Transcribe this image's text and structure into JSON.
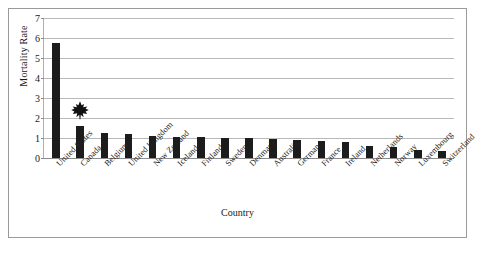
{
  "chart_data": {
    "type": "bar",
    "title": "",
    "xlabel": "Country",
    "ylabel": "Mortality Rate",
    "categories": [
      "United States",
      "Canada",
      "Belgium",
      "United Kingdom",
      "New Zealand",
      "Iceland",
      "Finland",
      "Sweden",
      "Denmark",
      "Australia",
      "Germany",
      "France",
      "Ireland",
      "Netherlands",
      "Norway",
      "Luxembourg",
      "Switzerland"
    ],
    "values": [
      5.75,
      1.6,
      1.25,
      1.2,
      1.1,
      1.05,
      1.05,
      1.0,
      1.0,
      0.95,
      0.9,
      0.85,
      0.8,
      0.6,
      0.55,
      0.4,
      0.35
    ],
    "ylim": [
      0,
      7
    ],
    "yticks": [
      "0",
      "1",
      "2",
      "3",
      "4",
      "5",
      "6",
      "7"
    ],
    "grid": true,
    "legend": "none",
    "bar_color": "#1c1c1c",
    "annotations": [
      {
        "name": "maple-leaf",
        "category": "Canada",
        "value": 2.4
      }
    ]
  },
  "figure": {
    "border_color": "#9a9a9a",
    "background": "#ffffff"
  }
}
